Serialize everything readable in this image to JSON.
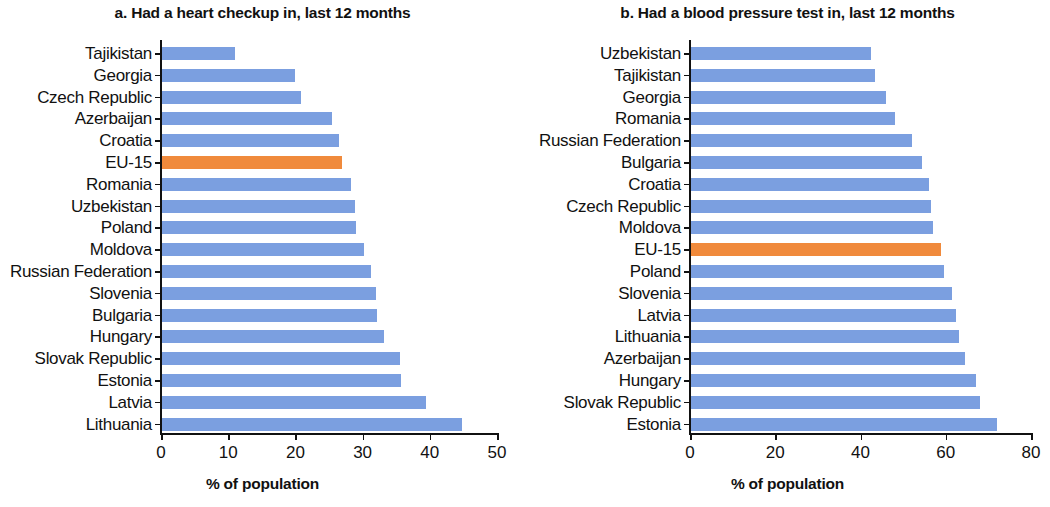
{
  "figure": {
    "panels": [
      {
        "id": "panel-a",
        "title": "a. Had a heart checkup in, last 12 months",
        "xlabel": "% of population"
      },
      {
        "id": "panel-b",
        "title": "b. Had a blood pressure test in, last 12 months",
        "xlabel": "% of population"
      }
    ]
  },
  "colors": {
    "bar_default": "#7B9FE0",
    "bar_highlight": "#F08A3C",
    "axis": "#111111",
    "text": "#111111",
    "background": "#FFFFFF"
  },
  "chart_data": [
    {
      "type": "bar",
      "orientation": "horizontal",
      "title": "a. Had a heart checkup in, last 12 months",
      "xlabel": "% of population",
      "ylabel": "",
      "xlim": [
        0,
        50
      ],
      "xticks": [
        0,
        10,
        20,
        30,
        40,
        50
      ],
      "xticklabels": [
        "0",
        "10",
        "20",
        "30",
        "40",
        "50"
      ],
      "grid": false,
      "legend": false,
      "highlight_category": "EU-15",
      "categories": [
        "Tajikistan",
        "Georgia",
        "Czech Republic",
        "Azerbaijan",
        "Croatia",
        "EU-15",
        "Romania",
        "Uzbekistan",
        "Poland",
        "Moldova",
        "Russian Federation",
        "Slovenia",
        "Bulgaria",
        "Hungary",
        "Slovak Republic",
        "Estonia",
        "Latvia",
        "Lithuania"
      ],
      "values": [
        11.0,
        20.0,
        20.8,
        25.5,
        26.5,
        27.0,
        28.2,
        28.8,
        29.0,
        30.2,
        31.2,
        32.0,
        32.2,
        33.2,
        35.5,
        35.7,
        39.5,
        44.8
      ]
    },
    {
      "type": "bar",
      "orientation": "horizontal",
      "title": "b. Had a blood pressure test in, last 12 months",
      "xlabel": "% of population",
      "ylabel": "",
      "xlim": [
        0,
        80
      ],
      "xticks": [
        0,
        20,
        40,
        60,
        80
      ],
      "xticklabels": [
        "0",
        "20",
        "40",
        "60",
        "80"
      ],
      "grid": false,
      "legend": false,
      "highlight_category": "EU-15",
      "categories": [
        "Uzbekistan",
        "Tajikistan",
        "Georgia",
        "Romania",
        "Russian Federation",
        "Bulgaria",
        "Croatia",
        "Czech Republic",
        "Moldova",
        "EU-15",
        "Poland",
        "Slovenia",
        "Latvia",
        "Lithuania",
        "Azerbaijan",
        "Hungary",
        "Slovak Republic",
        "Estonia"
      ],
      "values": [
        42.5,
        43.5,
        46.0,
        48.0,
        52.0,
        54.5,
        56.0,
        56.5,
        57.0,
        59.0,
        59.5,
        61.5,
        62.5,
        63.0,
        64.5,
        67.0,
        68.0,
        72.0
      ]
    }
  ]
}
